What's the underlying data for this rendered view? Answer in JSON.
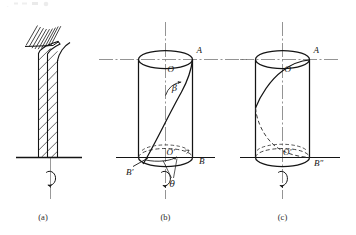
{
  "figure": {
    "type": "technical-line-diagram",
    "background_color": "#ffffff",
    "line_color": "#141414",
    "axis_color": "#555555",
    "dashed_color": "#3a3a3a",
    "panels": [
      {
        "id": "a",
        "caption": "(a)",
        "description": "Hatched vertical column fixed to a base with distributed load hatching at top and a torque rotation arrow about the vertical axis"
      },
      {
        "id": "b",
        "caption": "(b)",
        "description": "Cylinder with generatrix twisted from B prime to A, showing helix angle beta and twist angle theta",
        "labels": {
          "top_center": "O",
          "top_right": "A",
          "bottom_center": "O′",
          "bottom_right": "B",
          "bottom_left": "B′",
          "helix_angle": "β",
          "twist_angle": "θ"
        }
      },
      {
        "id": "c",
        "caption": "(c)",
        "description": "Cylinder with a full helical generatrix, solid in front and dashed behind, ending at B double prime",
        "labels": {
          "top_center": "O",
          "top_right": "A",
          "bottom_center": "O′",
          "bottom_right": "B″"
        }
      }
    ],
    "top_artifact": "."
  }
}
